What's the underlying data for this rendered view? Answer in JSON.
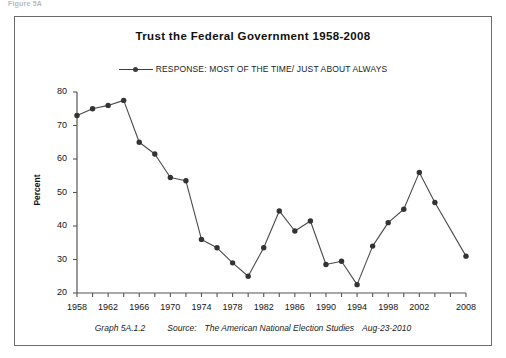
{
  "scan": {
    "top_cut_text": "Figure 5A"
  },
  "chart": {
    "title": "Trust the Federal Government 1958-2008",
    "legend": {
      "position": "top-center",
      "entries": [
        {
          "label": "RESPONSE: MOST OF THE TIME/ JUST ABOUT ALWAYS",
          "marker": "circle-marker",
          "color": "#3a3a3a"
        }
      ]
    },
    "footer": {
      "graph_id": "Graph 5A.1.2",
      "source_label": "Source:",
      "source_name": "The American National Election Studies",
      "date": "Aug-23-2010"
    },
    "colors": {
      "line": "#4a4a4a",
      "marker": "#333333",
      "axis": "#555555",
      "frame": "#6b6b6b",
      "background": "#ffffff"
    }
  },
  "chart_data": {
    "type": "line",
    "title": "Trust the Federal Government 1958-2008",
    "xlabel": "",
    "ylabel": "Percent",
    "ylim": [
      20,
      80
    ],
    "yticks": [
      20,
      30,
      40,
      50,
      60,
      70,
      80
    ],
    "xlim": [
      1958,
      2008
    ],
    "xticks": [
      1958,
      1962,
      1966,
      1970,
      1974,
      1978,
      1982,
      1986,
      1990,
      1994,
      1998,
      2002,
      2008
    ],
    "xtick_labels": [
      "1958",
      "1962",
      "1966",
      "1970",
      "1974",
      "1978",
      "1982",
      "1986",
      "1990",
      "1994",
      "1998",
      "2002",
      "2008"
    ],
    "minor_xtick_interval": 2,
    "grid": false,
    "legend_position": "top-center",
    "x": [
      1958,
      1960,
      1962,
      1964,
      1966,
      1968,
      1970,
      1972,
      1974,
      1976,
      1978,
      1980,
      1982,
      1984,
      1986,
      1988,
      1990,
      1992,
      1994,
      1996,
      1998,
      2000,
      2002,
      2004,
      2008
    ],
    "series": [
      {
        "name": "RESPONSE: MOST OF THE TIME/ JUST ABOUT ALWAYS",
        "values": [
          73.0,
          75.0,
          76.0,
          77.5,
          65.0,
          61.5,
          54.5,
          53.5,
          36.0,
          33.5,
          29.0,
          25.0,
          33.5,
          44.5,
          38.5,
          41.5,
          28.5,
          29.5,
          22.5,
          34.0,
          41.0,
          45.0,
          56.0,
          47.0,
          31.0
        ]
      }
    ]
  }
}
